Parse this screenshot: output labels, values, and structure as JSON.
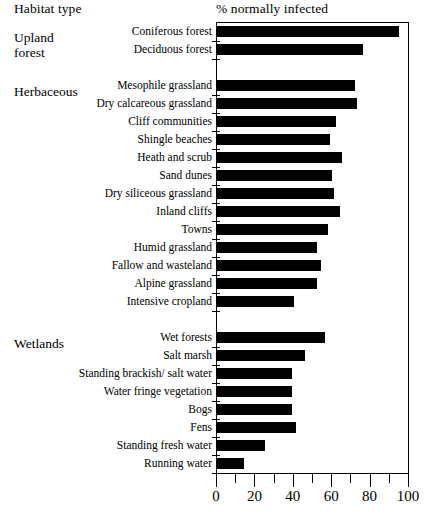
{
  "header": {
    "habitat_label": "Habitat type",
    "value_label": "% normally infected"
  },
  "groups": [
    {
      "name": "Upland\nforest",
      "top": 30
    },
    {
      "name": "Herbaceous",
      "top": 84
    },
    {
      "name": "Wetlands",
      "top": 336
    }
  ],
  "chart_data": {
    "type": "bar",
    "orientation": "horizontal",
    "title": "% normally infected",
    "xlabel": "% normally infected",
    "ylabel": "Habitat type",
    "xlim": [
      0,
      100
    ],
    "xticks": [
      0,
      20,
      40,
      60,
      80,
      100
    ],
    "xtick_labels": [
      "0",
      "20",
      "40",
      "60",
      "80",
      "100"
    ],
    "minor_tick_interval": 10,
    "grid": false,
    "legend": false,
    "bar_color": "#000000",
    "groups": [
      "Upland forest",
      "Herbaceous",
      "Wetlands"
    ],
    "categories": [
      "Coniferous forest",
      "Deciduous forest",
      "Mesophile grassland",
      "Dry calcareous grassland",
      "Cliff communities",
      "Shingle beaches",
      "Heath and scrub",
      "Sand dunes",
      "Dry siliceous grassland",
      "Inland cliffs",
      "Towns",
      "Humid grassland",
      "Fallow and wasteland",
      "Alpine grassland",
      "Intensive cropland",
      "Wet forests",
      "Salt marsh",
      "Standing brackish/ salt water",
      "Water fringe vegetation",
      "Bogs",
      "Fens",
      "Standing fresh water",
      "Running water"
    ],
    "values": [
      95,
      76,
      72,
      73,
      62,
      59,
      65,
      60,
      61,
      64,
      58,
      52,
      54,
      52,
      40,
      56,
      46,
      39,
      39,
      39,
      41,
      25,
      14
    ],
    "rows": [
      {
        "label": "Coniferous forest",
        "value": 95,
        "group": "Upland forest",
        "top": 24
      },
      {
        "label": "Deciduous forest",
        "value": 76,
        "group": "Upland forest",
        "top": 42
      },
      {
        "label": "Mesophile grassland",
        "value": 72,
        "group": "Herbaceous",
        "top": 78
      },
      {
        "label": "Dry calcareous grassland",
        "value": 73,
        "group": "Herbaceous",
        "top": 96
      },
      {
        "label": "Cliff communities",
        "value": 62,
        "group": "Herbaceous",
        "top": 114
      },
      {
        "label": "Shingle beaches",
        "value": 59,
        "group": "Herbaceous",
        "top": 132
      },
      {
        "label": "Heath and scrub",
        "value": 65,
        "group": "Herbaceous",
        "top": 150
      },
      {
        "label": "Sand dunes",
        "value": 60,
        "group": "Herbaceous",
        "top": 168
      },
      {
        "label": "Dry siliceous grassland",
        "value": 61,
        "group": "Herbaceous",
        "top": 186
      },
      {
        "label": "Inland cliffs",
        "value": 64,
        "group": "Herbaceous",
        "top": 204
      },
      {
        "label": "Towns",
        "value": 58,
        "group": "Herbaceous",
        "top": 222
      },
      {
        "label": "Humid grassland",
        "value": 52,
        "group": "Herbaceous",
        "top": 240
      },
      {
        "label": "Fallow and wasteland",
        "value": 54,
        "group": "Herbaceous",
        "top": 258
      },
      {
        "label": "Alpine grassland",
        "value": 52,
        "group": "Herbaceous",
        "top": 276
      },
      {
        "label": "Intensive cropland",
        "value": 40,
        "group": "Herbaceous",
        "top": 294
      },
      {
        "label": "Wet forests",
        "value": 56,
        "group": "Wetlands",
        "top": 330
      },
      {
        "label": "Salt marsh",
        "value": 46,
        "group": "Wetlands",
        "top": 348
      },
      {
        "label": "Standing brackish/ salt water",
        "value": 39,
        "group": "Wetlands",
        "top": 366
      },
      {
        "label": "Water fringe vegetation",
        "value": 39,
        "group": "Wetlands",
        "top": 384
      },
      {
        "label": "Bogs",
        "value": 39,
        "group": "Wetlands",
        "top": 402
      },
      {
        "label": "Fens",
        "value": 41,
        "group": "Wetlands",
        "top": 420
      },
      {
        "label": "Standing fresh water",
        "value": 25,
        "group": "Wetlands",
        "top": 438
      },
      {
        "label": "Running water",
        "value": 14,
        "group": "Wetlands",
        "top": 456
      }
    ]
  }
}
